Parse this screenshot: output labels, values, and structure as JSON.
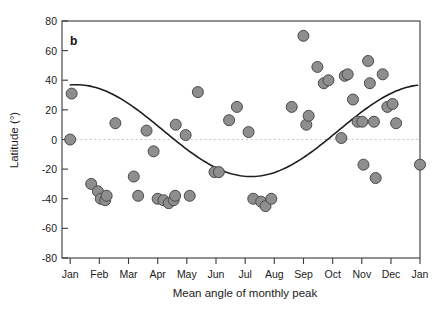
{
  "figure": {
    "panel_label": "b",
    "background": "#ffffff",
    "marker_color": "#8e8e8e",
    "marker_edge_color": "#4a4a4a",
    "curve_color": "#1d1d1d",
    "zeroline_color": "#c9c9c9"
  },
  "chart_data": {
    "type": "scatter",
    "title": "",
    "xlabel": "Mean angle of monthly peak",
    "ylabel": "Latitude (°)",
    "xticklabels": [
      "Jan",
      "Feb",
      "Mar",
      "Apr",
      "May",
      "Jun",
      "Jul",
      "Aug",
      "Sep",
      "Oct",
      "Nov",
      "Dec",
      "Jan"
    ],
    "xtickvalues": [
      0,
      1,
      2,
      3,
      4,
      5,
      6,
      7,
      8,
      9,
      10,
      11,
      12
    ],
    "yticklabels": [
      "-80",
      "-60",
      "-40",
      "-20",
      "0",
      "20",
      "40",
      "60",
      "80"
    ],
    "ytickvalues": [
      -80,
      -60,
      -40,
      -20,
      0,
      20,
      40,
      60,
      80
    ],
    "xlim": [
      -0.28,
      12.0
    ],
    "ylim": [
      -80,
      80
    ],
    "grid": false,
    "legend": null,
    "zero_reference_line": 0,
    "points": [
      {
        "x": 0.0,
        "y": 0
      },
      {
        "x": 0.05,
        "y": 31
      },
      {
        "x": 0.72,
        "y": -30
      },
      {
        "x": 0.95,
        "y": -35
      },
      {
        "x": 1.05,
        "y": -40
      },
      {
        "x": 1.2,
        "y": -41
      },
      {
        "x": 1.25,
        "y": -38
      },
      {
        "x": 1.55,
        "y": 11
      },
      {
        "x": 2.18,
        "y": -25
      },
      {
        "x": 2.33,
        "y": -38
      },
      {
        "x": 2.62,
        "y": 6
      },
      {
        "x": 2.86,
        "y": -8
      },
      {
        "x": 3.0,
        "y": -40
      },
      {
        "x": 3.2,
        "y": -41
      },
      {
        "x": 3.38,
        "y": -43
      },
      {
        "x": 3.55,
        "y": -41
      },
      {
        "x": 3.6,
        "y": -38
      },
      {
        "x": 3.62,
        "y": 10
      },
      {
        "x": 3.96,
        "y": 3
      },
      {
        "x": 4.1,
        "y": -38
      },
      {
        "x": 4.38,
        "y": 32
      },
      {
        "x": 4.95,
        "y": -22
      },
      {
        "x": 5.1,
        "y": -22
      },
      {
        "x": 5.45,
        "y": 13
      },
      {
        "x": 5.72,
        "y": 22
      },
      {
        "x": 6.12,
        "y": 5
      },
      {
        "x": 6.28,
        "y": -40
      },
      {
        "x": 6.55,
        "y": -42
      },
      {
        "x": 6.7,
        "y": -45
      },
      {
        "x": 6.9,
        "y": -40
      },
      {
        "x": 7.6,
        "y": 22
      },
      {
        "x": 8.0,
        "y": 70
      },
      {
        "x": 8.1,
        "y": 10
      },
      {
        "x": 8.18,
        "y": 16
      },
      {
        "x": 8.48,
        "y": 49
      },
      {
        "x": 8.7,
        "y": 38
      },
      {
        "x": 8.86,
        "y": 40
      },
      {
        "x": 9.3,
        "y": 1
      },
      {
        "x": 9.42,
        "y": 43
      },
      {
        "x": 9.52,
        "y": 44
      },
      {
        "x": 9.7,
        "y": 27
      },
      {
        "x": 9.86,
        "y": 12
      },
      {
        "x": 10.02,
        "y": 12
      },
      {
        "x": 10.06,
        "y": -17
      },
      {
        "x": 10.22,
        "y": 53
      },
      {
        "x": 10.28,
        "y": 38
      },
      {
        "x": 10.42,
        "y": 12
      },
      {
        "x": 10.48,
        "y": -26
      },
      {
        "x": 10.72,
        "y": 44
      },
      {
        "x": 10.88,
        "y": 22
      },
      {
        "x": 11.06,
        "y": 24
      },
      {
        "x": 11.18,
        "y": 11
      },
      {
        "x": 12.0,
        "y": -17
      }
    ],
    "fit_curve": {
      "description": "sinusoidal fit",
      "mean": 6.0,
      "amplitude": 31.0,
      "min_value": -25,
      "min_at": "Mar",
      "max_value": 37,
      "max_at": "Sep-Oct",
      "start_value": 0,
      "end_value": 0
    }
  }
}
